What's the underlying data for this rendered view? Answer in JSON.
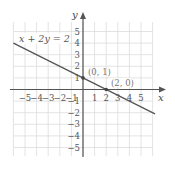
{
  "chart_data": {
    "type": "line",
    "title": "",
    "xlabel": "x",
    "ylabel": "y",
    "xlim": [
      -6,
      6
    ],
    "ylim": [
      -6,
      6
    ],
    "grid": true,
    "x_ticks": [
      "-5",
      "-4",
      "-3",
      "-2",
      "-1",
      "1",
      "2",
      "3",
      "4",
      "5"
    ],
    "y_ticks": [
      "5",
      "4",
      "3",
      "2",
      "1",
      "-1",
      "-2",
      "-3",
      "-4",
      "-5"
    ],
    "series": [
      {
        "name": "x + 2y = 2",
        "equation": "x + 2y = 2",
        "x": [
          -6,
          6.2
        ],
        "y": [
          4,
          -2.1
        ]
      }
    ],
    "points": [
      {
        "label": "(0, 1)",
        "x": 0,
        "y": 1
      },
      {
        "label": "(2, 0)",
        "x": 2,
        "y": 0
      }
    ],
    "annotations": [
      "x + 2y = 2",
      "(0, 1)",
      "(2, 0)"
    ]
  },
  "labels": {
    "equation": "x + 2y = 2",
    "x_axis": "x",
    "y_axis": "y",
    "point_a": "(0, 1)",
    "point_b": "(2, 0)",
    "xt": [
      "−5",
      "−4",
      "−3",
      "−2",
      "−1",
      "1",
      "2",
      "3",
      "4",
      "5"
    ],
    "yt": [
      "5",
      "4",
      "3",
      "2",
      "1",
      "−1",
      "−2",
      "−3",
      "−4",
      "−5"
    ]
  },
  "colors": {
    "grid": "#dcdcdc",
    "axis": "#555555",
    "line": "#555555",
    "point": "#444444"
  }
}
